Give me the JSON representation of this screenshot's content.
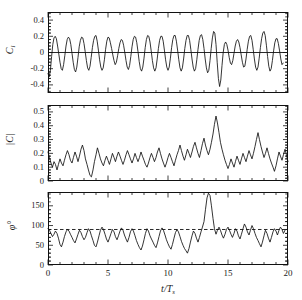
{
  "figure": {
    "type": "multi-panel-time-series",
    "panel_count": 3,
    "shared_x": true,
    "xlabel": "t/T",
    "xlabel_sub": "s",
    "background": "#ffffff",
    "line_color": "#111111"
  },
  "chart_data": [
    {
      "type": "line",
      "title": "",
      "panel_index": 0,
      "ylabel": "C",
      "ylabel_sub": "l",
      "xlabel": "t/T s",
      "xlim": [
        0,
        20
      ],
      "ylim": [
        -0.5,
        0.5
      ],
      "yticks": [
        -0.4,
        -0.2,
        0,
        0.2,
        0.4
      ],
      "ytick_labels": [
        "-0.4",
        "-0.2",
        "0",
        "0.2",
        "0.4"
      ],
      "xticks": [
        0,
        5,
        10,
        15,
        20
      ],
      "xtick_labels": [
        "0",
        "5",
        "10",
        "15",
        "20"
      ],
      "grid": false,
      "legend": "none",
      "reference_line": {
        "y": 0,
        "style": "solid"
      },
      "x": [
        0.0,
        0.1,
        0.2,
        0.3,
        0.4,
        0.5,
        0.6,
        0.7,
        0.8,
        0.9,
        1.0,
        1.1,
        1.2,
        1.3,
        1.4,
        1.5,
        1.6,
        1.7,
        1.8,
        1.9,
        2.0,
        2.1,
        2.2,
        2.3,
        2.4,
        2.5,
        2.6,
        2.7,
        2.8,
        2.9,
        3.0,
        3.1,
        3.2,
        3.3,
        3.4,
        3.5,
        3.6,
        3.7,
        3.8,
        3.9,
        4.0,
        4.1,
        4.2,
        4.3,
        4.4,
        4.5,
        4.6,
        4.7,
        4.8,
        4.9,
        5.0,
        5.1,
        5.2,
        5.3,
        5.4,
        5.5,
        5.6,
        5.7,
        5.8,
        5.9,
        6.0,
        6.1,
        6.2,
        6.3,
        6.4,
        6.5,
        6.6,
        6.7,
        6.8,
        6.9,
        7.0,
        7.1,
        7.2,
        7.3,
        7.4,
        7.5,
        7.6,
        7.7,
        7.8,
        7.9,
        8.0,
        8.1,
        8.2,
        8.3,
        8.4,
        8.5,
        8.6,
        8.7,
        8.8,
        8.9,
        9.0,
        9.1,
        9.2,
        9.3,
        9.4,
        9.5,
        9.6,
        9.7,
        9.8,
        9.9,
        10.0,
        10.1,
        10.2,
        10.3,
        10.4,
        10.5,
        10.6,
        10.7,
        10.8,
        10.9,
        11.0,
        11.1,
        11.2,
        11.3,
        11.4,
        11.5,
        11.6,
        11.7,
        11.8,
        11.9,
        12.0,
        12.1,
        12.2,
        12.3,
        12.4,
        12.5,
        12.6,
        12.7,
        12.8,
        12.9,
        13.0,
        13.1,
        13.2,
        13.3,
        13.4,
        13.5,
        13.6,
        13.7,
        13.8,
        13.9,
        14.0,
        14.1,
        14.2,
        14.3,
        14.4,
        14.5,
        14.6,
        14.7,
        14.8,
        14.9,
        15.0,
        15.1,
        15.2,
        15.3,
        15.4,
        15.5,
        15.6,
        15.7,
        15.8,
        15.9,
        16.0,
        16.1,
        16.2,
        16.3,
        16.4,
        16.5,
        16.6,
        16.7,
        16.8,
        16.9,
        17.0,
        17.1,
        17.2,
        17.3,
        17.4,
        17.5,
        17.6,
        17.7,
        17.8,
        17.9,
        18.0,
        18.1,
        18.2,
        18.3,
        18.4,
        18.5,
        18.6,
        18.7,
        18.8,
        18.9,
        19.0,
        19.1,
        19.2,
        19.3,
        19.4,
        19.5,
        19.6,
        19.7,
        19.8,
        19.9,
        20.0
      ],
      "y": [
        -0.26,
        -0.3,
        -0.22,
        -0.05,
        0.1,
        0.18,
        0.2,
        0.17,
        0.08,
        -0.02,
        -0.12,
        -0.2,
        -0.22,
        -0.15,
        -0.04,
        0.08,
        0.16,
        0.19,
        0.17,
        0.1,
        -0.01,
        -0.12,
        -0.21,
        -0.24,
        -0.18,
        -0.06,
        0.07,
        0.15,
        0.19,
        0.18,
        0.11,
        0.01,
        -0.1,
        -0.19,
        -0.22,
        -0.17,
        -0.06,
        0.06,
        0.15,
        0.2,
        0.21,
        0.14,
        0.03,
        -0.09,
        -0.18,
        -0.22,
        -0.19,
        -0.09,
        0.04,
        0.14,
        0.19,
        0.18,
        0.12,
        0.05,
        -0.03,
        -0.1,
        -0.15,
        -0.12,
        -0.04,
        0.05,
        0.12,
        0.16,
        0.15,
        0.09,
        0.0,
        -0.1,
        -0.18,
        -0.21,
        -0.16,
        -0.05,
        0.07,
        0.16,
        0.2,
        0.19,
        0.12,
        0.01,
        -0.11,
        -0.2,
        -0.23,
        -0.18,
        -0.07,
        0.06,
        0.16,
        0.21,
        0.2,
        0.13,
        0.02,
        -0.1,
        -0.19,
        -0.23,
        -0.19,
        -0.08,
        0.05,
        0.15,
        0.2,
        0.2,
        0.14,
        0.03,
        -0.09,
        -0.18,
        -0.22,
        -0.18,
        -0.07,
        0.06,
        0.16,
        0.21,
        0.21,
        0.14,
        0.03,
        -0.09,
        -0.19,
        -0.23,
        -0.19,
        -0.08,
        0.05,
        0.15,
        0.21,
        0.21,
        0.15,
        0.04,
        -0.08,
        -0.18,
        -0.23,
        -0.2,
        -0.09,
        0.04,
        0.15,
        0.21,
        0.22,
        0.16,
        0.05,
        -0.08,
        -0.19,
        -0.25,
        -0.22,
        -0.1,
        0.05,
        0.18,
        0.26,
        0.24,
        0.1,
        -0.12,
        -0.32,
        -0.42,
        -0.34,
        -0.16,
        0.0,
        0.1,
        0.13,
        0.1,
        0.03,
        -0.06,
        -0.13,
        -0.15,
        -0.1,
        -0.01,
        0.08,
        0.14,
        0.16,
        0.13,
        0.06,
        -0.03,
        -0.12,
        -0.18,
        -0.17,
        -0.08,
        0.04,
        0.14,
        0.2,
        0.21,
        0.15,
        0.04,
        -0.08,
        -0.18,
        -0.22,
        -0.18,
        -0.07,
        0.06,
        0.17,
        0.24,
        0.26,
        0.21,
        0.09,
        -0.05,
        -0.17,
        -0.23,
        -0.2,
        -0.1,
        0.02,
        0.12,
        0.17,
        0.17,
        0.11,
        0.02,
        -0.08,
        -0.15,
        -0.13
      ]
    },
    {
      "type": "line",
      "title": "",
      "panel_index": 1,
      "ylabel": "|C|",
      "ylabel_sub": "l",
      "xlabel": "t/T s",
      "xlim": [
        0,
        20
      ],
      "ylim": [
        0,
        0.55
      ],
      "yticks": [
        0,
        0.1,
        0.2,
        0.3,
        0.4,
        0.5
      ],
      "ytick_labels": [
        "0",
        "0.1",
        "0.2",
        "0.3",
        "0.4",
        "0.5"
      ],
      "xticks": [
        0,
        5,
        10,
        15,
        20
      ],
      "xtick_labels": [
        "0",
        "5",
        "10",
        "15",
        "20"
      ],
      "grid": false,
      "legend": "none",
      "x": [
        0.0,
        0.12,
        0.25,
        0.37,
        0.5,
        0.62,
        0.75,
        0.87,
        1.0,
        1.12,
        1.25,
        1.37,
        1.5,
        1.62,
        1.75,
        1.87,
        2.0,
        2.12,
        2.25,
        2.37,
        2.5,
        2.62,
        2.75,
        2.87,
        3.0,
        3.12,
        3.25,
        3.37,
        3.5,
        3.62,
        3.75,
        3.87,
        4.0,
        4.12,
        4.25,
        4.37,
        4.5,
        4.62,
        4.75,
        4.87,
        5.0,
        5.12,
        5.25,
        5.37,
        5.5,
        5.62,
        5.75,
        5.87,
        6.0,
        6.12,
        6.25,
        6.37,
        6.5,
        6.62,
        6.75,
        6.87,
        7.0,
        7.12,
        7.25,
        7.37,
        7.5,
        7.62,
        7.75,
        7.87,
        8.0,
        8.12,
        8.25,
        8.37,
        8.5,
        8.62,
        8.75,
        8.87,
        9.0,
        9.12,
        9.25,
        9.37,
        9.5,
        9.62,
        9.75,
        9.87,
        10.0,
        10.12,
        10.25,
        10.37,
        10.5,
        10.62,
        10.75,
        10.87,
        11.0,
        11.12,
        11.25,
        11.37,
        11.5,
        11.62,
        11.75,
        11.87,
        12.0,
        12.12,
        12.25,
        12.37,
        12.5,
        12.62,
        12.75,
        12.87,
        13.0,
        13.12,
        13.25,
        13.37,
        13.5,
        13.62,
        13.75,
        13.87,
        14.0,
        14.12,
        14.25,
        14.37,
        14.5,
        14.62,
        14.75,
        14.87,
        15.0,
        15.12,
        15.25,
        15.37,
        15.5,
        15.62,
        15.75,
        15.87,
        16.0,
        16.12,
        16.25,
        16.37,
        16.5,
        16.62,
        16.75,
        16.87,
        17.0,
        17.12,
        17.25,
        17.37,
        17.5,
        17.62,
        17.75,
        17.87,
        18.0,
        18.12,
        18.25,
        18.37,
        18.5,
        18.62,
        18.75,
        18.87,
        19.0,
        19.12,
        19.25,
        19.37,
        19.5,
        19.62,
        19.75,
        19.87,
        20.0
      ],
      "y": [
        0.21,
        0.17,
        0.13,
        0.1,
        0.14,
        0.12,
        0.08,
        0.12,
        0.16,
        0.13,
        0.11,
        0.15,
        0.19,
        0.22,
        0.19,
        0.15,
        0.13,
        0.17,
        0.21,
        0.18,
        0.14,
        0.18,
        0.23,
        0.26,
        0.22,
        0.16,
        0.12,
        0.08,
        0.04,
        0.03,
        0.08,
        0.14,
        0.19,
        0.24,
        0.2,
        0.16,
        0.13,
        0.11,
        0.15,
        0.18,
        0.15,
        0.12,
        0.16,
        0.2,
        0.17,
        0.14,
        0.18,
        0.21,
        0.18,
        0.15,
        0.12,
        0.15,
        0.19,
        0.22,
        0.19,
        0.16,
        0.13,
        0.16,
        0.2,
        0.17,
        0.14,
        0.17,
        0.21,
        0.18,
        0.15,
        0.12,
        0.1,
        0.13,
        0.17,
        0.2,
        0.17,
        0.14,
        0.17,
        0.21,
        0.24,
        0.2,
        0.16,
        0.13,
        0.1,
        0.13,
        0.17,
        0.2,
        0.17,
        0.14,
        0.11,
        0.15,
        0.19,
        0.22,
        0.26,
        0.22,
        0.18,
        0.15,
        0.19,
        0.23,
        0.2,
        0.17,
        0.21,
        0.25,
        0.28,
        0.24,
        0.2,
        0.17,
        0.22,
        0.27,
        0.31,
        0.26,
        0.22,
        0.19,
        0.23,
        0.28,
        0.34,
        0.41,
        0.47,
        0.42,
        0.35,
        0.28,
        0.23,
        0.19,
        0.15,
        0.12,
        0.09,
        0.12,
        0.16,
        0.13,
        0.1,
        0.14,
        0.18,
        0.15,
        0.12,
        0.16,
        0.2,
        0.17,
        0.14,
        0.18,
        0.22,
        0.19,
        0.16,
        0.2,
        0.25,
        0.3,
        0.35,
        0.3,
        0.25,
        0.21,
        0.17,
        0.2,
        0.24,
        0.2,
        0.16,
        0.13,
        0.1,
        0.07,
        0.11,
        0.16,
        0.21,
        0.18,
        0.15,
        0.19,
        0.23,
        0.19,
        0.14
      ]
    },
    {
      "type": "line",
      "title": "",
      "panel_index": 2,
      "ylabel": "φ°",
      "xlabel": "t/T s",
      "xlim": [
        0,
        20
      ],
      "ylim": [
        0,
        185
      ],
      "yticks": [
        0,
        50,
        100,
        150
      ],
      "ytick_labels": [
        "0",
        "50",
        "100",
        "150"
      ],
      "xticks": [
        0,
        5,
        10,
        15,
        20
      ],
      "xtick_labels": [
        "0",
        "5",
        "10",
        "15",
        "20"
      ],
      "grid": false,
      "legend": "none",
      "reference_line": {
        "y": 90,
        "style": "dashed"
      },
      "x": [
        0.0,
        0.12,
        0.25,
        0.37,
        0.5,
        0.62,
        0.75,
        0.87,
        1.0,
        1.12,
        1.25,
        1.37,
        1.5,
        1.62,
        1.75,
        1.87,
        2.0,
        2.12,
        2.25,
        2.37,
        2.5,
        2.62,
        2.75,
        2.87,
        3.0,
        3.12,
        3.25,
        3.37,
        3.5,
        3.62,
        3.75,
        3.87,
        4.0,
        4.12,
        4.25,
        4.37,
        4.5,
        4.62,
        4.75,
        4.87,
        5.0,
        5.12,
        5.25,
        5.37,
        5.5,
        5.62,
        5.75,
        5.87,
        6.0,
        6.12,
        6.25,
        6.37,
        6.5,
        6.62,
        6.75,
        6.87,
        7.0,
        7.12,
        7.25,
        7.37,
        7.5,
        7.62,
        7.75,
        7.87,
        8.0,
        8.12,
        8.25,
        8.37,
        8.5,
        8.62,
        8.75,
        8.87,
        9.0,
        9.12,
        9.25,
        9.37,
        9.5,
        9.62,
        9.75,
        9.87,
        10.0,
        10.12,
        10.25,
        10.37,
        10.5,
        10.62,
        10.75,
        10.87,
        11.0,
        11.12,
        11.25,
        11.37,
        11.5,
        11.62,
        11.75,
        11.87,
        12.0,
        12.12,
        12.25,
        12.37,
        12.5,
        12.62,
        12.75,
        12.87,
        13.0,
        13.12,
        13.25,
        13.37,
        13.5,
        13.62,
        13.75,
        13.87,
        14.0,
        14.12,
        14.25,
        14.37,
        14.5,
        14.62,
        14.75,
        14.87,
        15.0,
        15.12,
        15.25,
        15.37,
        15.5,
        15.62,
        15.75,
        15.87,
        16.0,
        16.12,
        16.25,
        16.37,
        16.5,
        16.62,
        16.75,
        16.87,
        17.0,
        17.12,
        17.25,
        17.37,
        17.5,
        17.62,
        17.75,
        17.87,
        18.0,
        18.12,
        18.25,
        18.37,
        18.5,
        18.62,
        18.75,
        18.87,
        19.0,
        19.12,
        19.25,
        19.37,
        19.5,
        19.62,
        19.75,
        19.87,
        20.0
      ],
      "y": [
        92,
        88,
        80,
        72,
        78,
        86,
        80,
        68,
        52,
        46,
        58,
        72,
        84,
        90,
        86,
        78,
        70,
        62,
        56,
        66,
        78,
        88,
        82,
        72,
        64,
        70,
        82,
        92,
        86,
        74,
        62,
        50,
        46,
        58,
        74,
        88,
        96,
        90,
        78,
        66,
        58,
        68,
        80,
        90,
        84,
        72,
        64,
        74,
        86,
        94,
        88,
        76,
        66,
        58,
        70,
        84,
        92,
        86,
        74,
        62,
        52,
        44,
        38,
        48,
        64,
        80,
        92,
        86,
        74,
        66,
        58,
        50,
        44,
        56,
        72,
        86,
        94,
        88,
        76,
        64,
        54,
        46,
        40,
        52,
        68,
        82,
        90,
        84,
        72,
        60,
        50,
        42,
        36,
        30,
        42,
        58,
        74,
        86,
        80,
        68,
        58,
        70,
        84,
        96,
        110,
        140,
        170,
        182,
        176,
        150,
        118,
        92,
        78,
        88,
        96,
        88,
        76,
        68,
        78,
        90,
        96,
        88,
        78,
        70,
        80,
        92,
        86,
        74,
        66,
        78,
        92,
        104,
        96,
        84,
        76,
        88,
        100,
        92,
        80,
        70,
        62,
        54,
        46,
        58,
        74,
        88,
        80,
        68,
        58,
        70,
        84,
        92,
        86,
        76,
        88,
        96,
        90,
        80,
        88
      ]
    }
  ]
}
